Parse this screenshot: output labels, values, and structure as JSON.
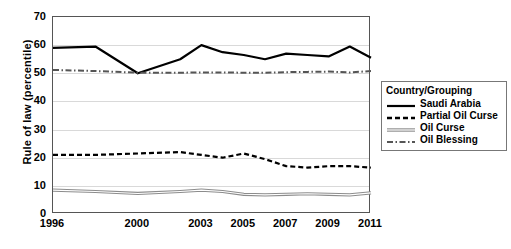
{
  "chart_data": {
    "type": "line",
    "title": "",
    "xlabel": "",
    "ylabel": "Rule of law (percentile)",
    "ylim": [
      0,
      70
    ],
    "ytick_values": [
      0,
      10,
      20,
      30,
      40,
      50,
      60,
      70
    ],
    "xtick_labels": [
      "1996",
      "2000",
      "2003",
      "2005",
      "2007",
      "2009",
      "2011"
    ],
    "x": [
      1996,
      1998,
      2000,
      2002,
      2003,
      2004,
      2005,
      2006,
      2007,
      2008,
      2009,
      2010,
      2011
    ],
    "grid": true,
    "legend_position": "right",
    "legend_title": "Country/Grouping",
    "series": [
      {
        "name": "Saudi Arabia",
        "style": "solid",
        "color": "#000000",
        "width": 2.2,
        "values": [
          59,
          59.5,
          50,
          55,
          60,
          57.5,
          56.5,
          55,
          57,
          56.5,
          56,
          59.5,
          55.5
        ]
      },
      {
        "name": "Partial Oil Curse",
        "style": "dashed",
        "color": "#000000",
        "width": 2.2,
        "values": [
          21,
          21,
          21.5,
          22,
          21,
          20,
          21.5,
          19.5,
          17,
          16.5,
          17,
          17,
          16.5
        ]
      },
      {
        "name": "Oil Curse",
        "style": "double",
        "color": "#7a7a7a",
        "width": 1.4,
        "values": [
          8.5,
          8,
          7.3,
          8,
          8.5,
          8,
          7,
          6.8,
          7,
          7.2,
          7,
          6.8,
          7.5
        ]
      },
      {
        "name": "Oil Blessing",
        "style": "dashdot",
        "color": "#555555",
        "width": 2.0,
        "values": [
          51.2,
          50.8,
          50.2,
          50.2,
          50.3,
          50.3,
          50.2,
          50.2,
          50.4,
          50.5,
          50.6,
          50.3,
          50.8
        ]
      }
    ]
  },
  "legend": {
    "title": "Country/Grouping",
    "items": [
      {
        "label": "Saudi Arabia"
      },
      {
        "label": "Partial Oil Curse"
      },
      {
        "label": "Oil Curse"
      },
      {
        "label": "Oil Blessing"
      }
    ]
  },
  "axis": {
    "y_title": "Rule of law (percentile)"
  }
}
